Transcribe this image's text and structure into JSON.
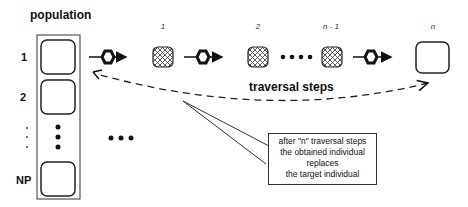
{
  "population": {
    "title": "population",
    "row_labels": [
      "1",
      "2",
      "NP"
    ],
    "side_dots": ". . ."
  },
  "traversal": {
    "step_labels": [
      "1",
      "2",
      "n - 1",
      "n"
    ],
    "label": "traversal steps"
  },
  "callout": {
    "lines": [
      "after \"n\" traversal steps",
      "the obtained individual",
      "replaces",
      "the target individual"
    ]
  },
  "icons": {
    "operator": "hexagon-icon",
    "intermediate_individual": "crosshatched-square-icon",
    "final_individual": "rounded-square-icon"
  }
}
